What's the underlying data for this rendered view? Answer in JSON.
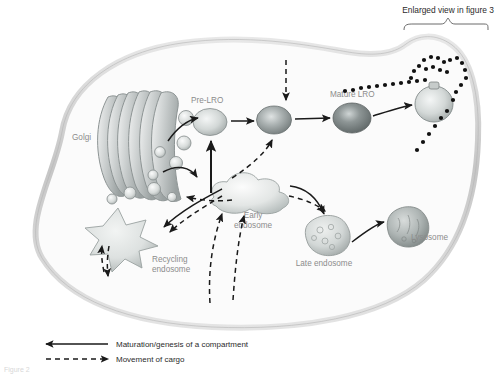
{
  "figure": {
    "title_annotation": "Enlarged view in figure 3",
    "caption_partial": "Figure 2"
  },
  "organelles": [
    {
      "id": "golgi",
      "label": "Golgi",
      "x": 72,
      "y": 137
    },
    {
      "id": "pre-lro",
      "label": "Pre-LRO",
      "x": 214,
      "y": 103
    },
    {
      "id": "mature-lro",
      "label": "Mature LRO",
      "x": 357,
      "y": 97
    },
    {
      "id": "early-endo",
      "label": "Early\nendosome",
      "x": 253,
      "y": 216
    },
    {
      "id": "late-endo",
      "label": "Late endosome",
      "x": 324,
      "y": 254
    },
    {
      "id": "lysosome",
      "label": "Lysosome",
      "x": 411,
      "y": 238
    },
    {
      "id": "recycling",
      "label": "Recycling\nendosome",
      "x": 135,
      "y": 261
    }
  ],
  "organelle_labels": {
    "golgi": "Golgi",
    "pre_lro": "Pre-LRO",
    "mature_lro": "Mature LRO",
    "early_endosome_line1": "Early",
    "early_endosome_line2": "endosome",
    "late_endosome": "Late endosome",
    "lysosome": "Lysosome",
    "recycling_line1": "Recycling",
    "recycling_line2": "endosome"
  },
  "legend": {
    "items": [
      {
        "style": "solid",
        "label": "Maturation/genesis of a compartment"
      },
      {
        "style": "dashed",
        "label": "Movement of cargo"
      }
    ]
  },
  "colors": {
    "membrane": "#c9c9c9",
    "cytoplasm": "#fbfbfb",
    "label_gray": "#8c8c8c",
    "arrow_black": "#1a1a1a",
    "lro_light": "#cfd3d2",
    "lro_mid": "#9aa0a0",
    "lro_dark": "#6e7676"
  },
  "diagram_meta": {
    "type": "cell-biology-schematic",
    "subject": "LRO biogenesis and endosomal trafficking"
  }
}
